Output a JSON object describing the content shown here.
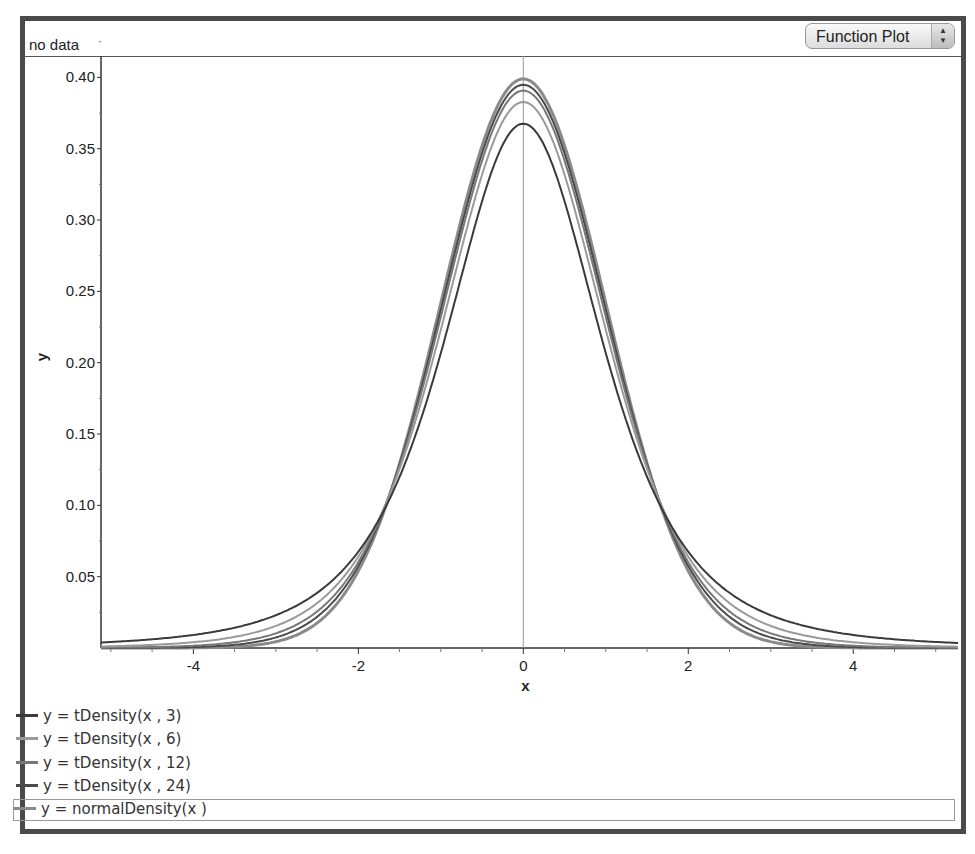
{
  "header": {
    "status_text": "no data",
    "plot_type_select": "Function Plot"
  },
  "chart_data": {
    "type": "line",
    "title": "",
    "xlabel": "x",
    "ylabel": "y",
    "xlim": [
      -5.12,
      5.27
    ],
    "ylim": [
      0.0,
      0.415
    ],
    "x_ticks": [
      -4,
      -2,
      0,
      2,
      4
    ],
    "y_ticks": [
      0.05,
      0.1,
      0.15,
      0.2,
      0.25,
      0.3,
      0.35,
      0.4
    ],
    "y_tick_labels": [
      "0.05",
      "0.10",
      "0.15",
      "0.20",
      "0.25",
      "0.30",
      "0.35",
      "0.40"
    ],
    "grid": false,
    "legend_position": "bottom",
    "series": [
      {
        "name": "y = tDensity(x , 3)",
        "df": 3,
        "color": "#3a3a3a",
        "peak": 0.3676
      },
      {
        "name": "y = tDensity(x , 6)",
        "df": 6,
        "color": "#9a9a9a",
        "peak": 0.3827
      },
      {
        "name": "y = tDensity(x , 12)",
        "df": 12,
        "color": "#777777",
        "peak": 0.3907
      },
      {
        "name": "y = tDensity(x , 24)",
        "df": 24,
        "color": "#4a4a4a",
        "peak": 0.3948
      },
      {
        "name": "y = normalDensity(x )",
        "df": null,
        "color": "#8a8a8a",
        "peak": 0.3989
      }
    ]
  },
  "legend": {
    "items": [
      {
        "label": "y = tDensity(x , 3)",
        "color": "#3a3a3a"
      },
      {
        "label": "y = tDensity(x , 6)",
        "color": "#9a9a9a"
      },
      {
        "label": "y = tDensity(x , 12)",
        "color": "#777777"
      },
      {
        "label": "y = tDensity(x , 24)",
        "color": "#4a4a4a"
      },
      {
        "label": "y = normalDensity(x )",
        "color": "#8a8a8a"
      }
    ]
  }
}
